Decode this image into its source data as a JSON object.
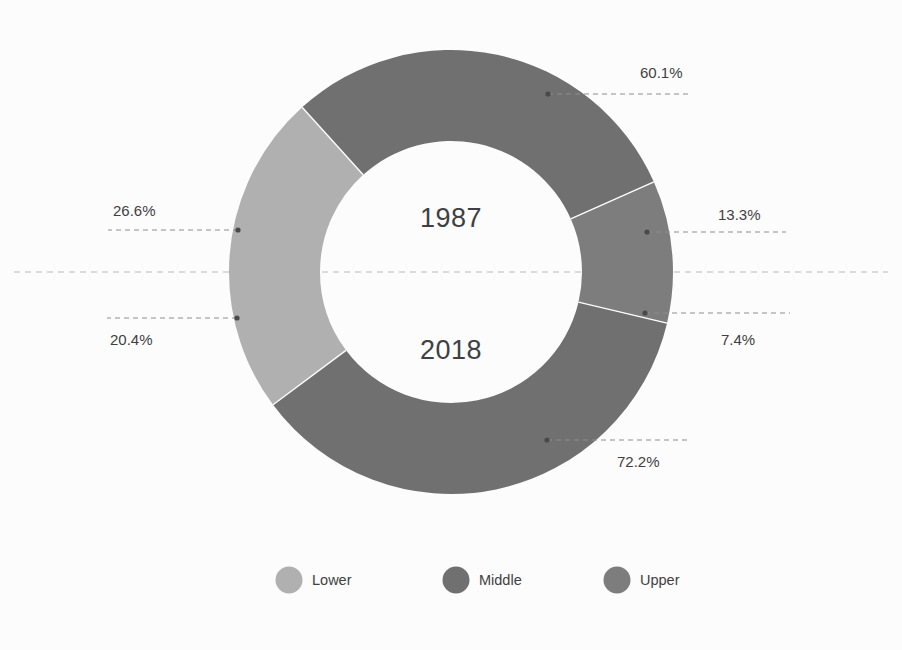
{
  "chart_data": {
    "type": "pie",
    "variant": "半 semi-donut pair",
    "title": "",
    "subtitle": "",
    "xlabel": "",
    "ylabel": "",
    "grid": false,
    "legend_position": "bottom-center",
    "categories": [
      "Lower",
      "Middle",
      "Upper"
    ],
    "series": [
      {
        "name": "1987",
        "values": [
          26.6,
          60.1,
          13.3
        ]
      },
      {
        "name": "2018",
        "values": [
          20.4,
          72.2,
          7.4
        ]
      }
    ],
    "charts": [
      {
        "center_label": "1987",
        "half": "top",
        "slices": [
          {
            "name": "Lower",
            "value": 26.6,
            "label": "26.6%",
            "color": "#b0b0b0"
          },
          {
            "name": "Middle",
            "value": 60.1,
            "label": "60.1%",
            "color": "#707070"
          },
          {
            "name": "Upper",
            "value": 13.3,
            "label": "13.3%",
            "color": "#7d7d7d"
          }
        ]
      },
      {
        "center_label": "2018",
        "half": "bottom",
        "slices": [
          {
            "name": "Lower",
            "value": 20.4,
            "label": "20.4%",
            "color": "#b0b0b0"
          },
          {
            "name": "Middle",
            "value": 72.2,
            "label": "72.2%",
            "color": "#707070"
          },
          {
            "name": "Upper",
            "value": 7.4,
            "label": "7.4%",
            "color": "#7d7d7d"
          }
        ]
      }
    ]
  },
  "center": {
    "top_year": "1987",
    "bottom_year": "2018"
  },
  "labels": {
    "top_middle": "60.1%",
    "top_upper": "13.3%",
    "top_lower": "26.6%",
    "bottom_lower": "20.4%",
    "bottom_upper": "7.4%",
    "bottom_middle": "72.2%"
  },
  "legend": {
    "items": [
      {
        "label": "Lower",
        "color": "#b0b0b0"
      },
      {
        "label": "Middle",
        "color": "#707070"
      },
      {
        "label": "Upper",
        "color": "#7d7d7d"
      }
    ]
  },
  "colors": {
    "background": "#fcfcfc",
    "lower": "#b0b0b0",
    "middle": "#707070",
    "upper": "#7d7d7d",
    "text": "#3f3f44",
    "leader": "#8d8d8d",
    "divider": "#b9b9b9"
  }
}
